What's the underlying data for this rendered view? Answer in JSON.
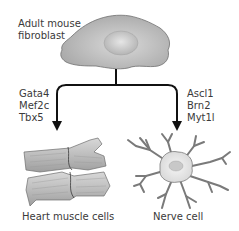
{
  "diagram": {
    "source_cell": {
      "label_line1": "Adult mouse",
      "label_line2": "fibroblast"
    },
    "left_branch": {
      "factors": [
        "Gata4",
        "Mef2c",
        "Tbx5"
      ],
      "target_label": "Heart muscle cells"
    },
    "right_branch": {
      "factors": [
        "Ascl1",
        "Brn2",
        "Myt1l"
      ],
      "target_label": "Nerve cell"
    },
    "colors": {
      "cell_fill": "#b8b8b8",
      "cell_outline": "#6a6a6a",
      "arrow": "#111111",
      "text": "#3a3a3a"
    }
  }
}
